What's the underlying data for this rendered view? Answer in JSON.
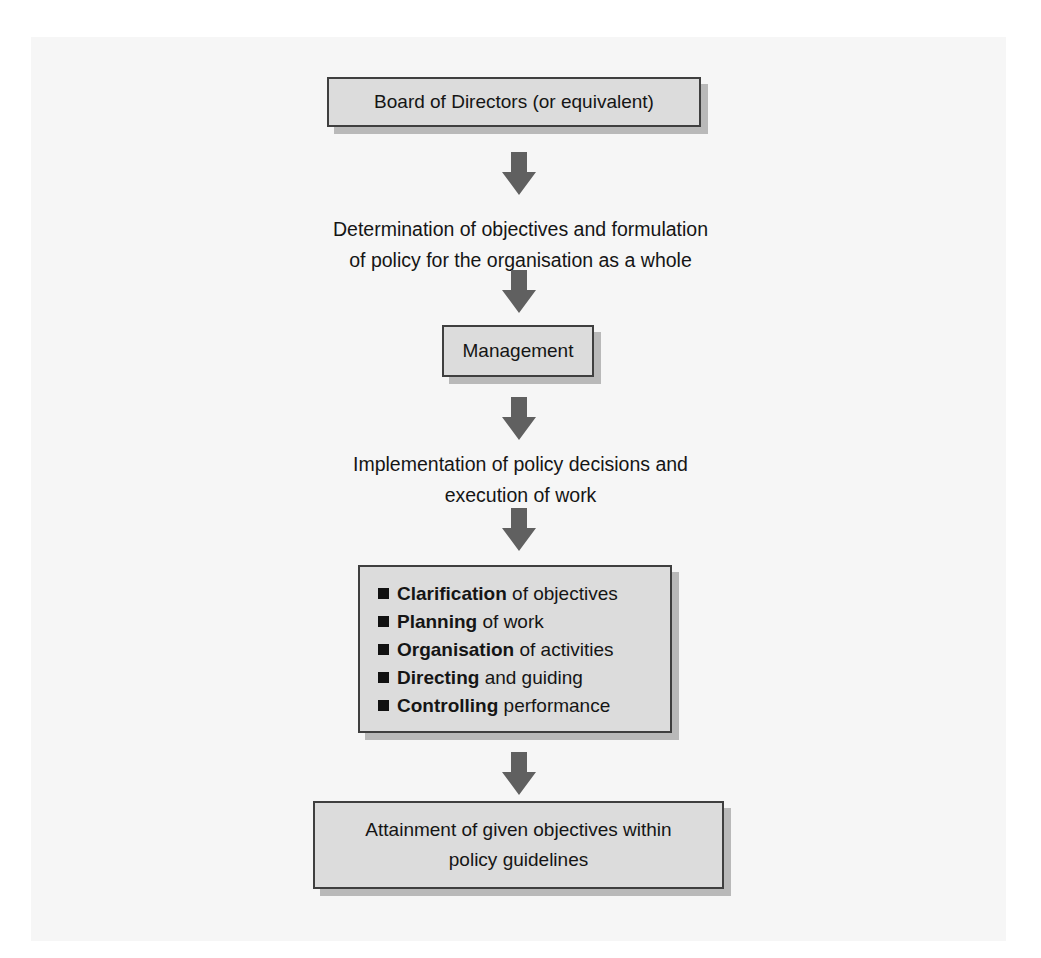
{
  "diagram": {
    "nodes": [
      {
        "id": "board",
        "type": "box",
        "label": "Board of Directors (or equivalent)"
      },
      {
        "id": "determination",
        "type": "text",
        "lines": [
          "Determination of objectives and formulation",
          "of policy for the organisation as a whole"
        ]
      },
      {
        "id": "management",
        "type": "box",
        "label": "Management"
      },
      {
        "id": "implementation",
        "type": "text",
        "lines": [
          "Implementation of policy decisions and",
          "execution of work"
        ]
      },
      {
        "id": "functions",
        "type": "box-list",
        "items": [
          {
            "bold": "Clarification",
            "rest": " of objectives"
          },
          {
            "bold": "Planning",
            "rest": " of work"
          },
          {
            "bold": "Organisation",
            "rest": " of activities"
          },
          {
            "bold": "Directing",
            "rest": " and guiding"
          },
          {
            "bold": "Controlling",
            "rest": " performance"
          }
        ]
      },
      {
        "id": "attainment",
        "type": "box",
        "lines": [
          "Attainment of given objectives within",
          "policy guidelines"
        ]
      }
    ],
    "edges": [
      [
        "board",
        "determination"
      ],
      [
        "determination",
        "management"
      ],
      [
        "management",
        "implementation"
      ],
      [
        "implementation",
        "functions"
      ],
      [
        "functions",
        "attainment"
      ]
    ],
    "colors": {
      "box_fill": "#dcdcdc",
      "box_border": "#3f3f3f",
      "box_shadow": "#b9b9b9",
      "arrow": "#606060",
      "background": "#f6f6f6"
    }
  }
}
